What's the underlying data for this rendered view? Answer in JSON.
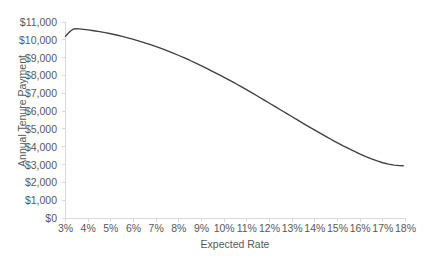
{
  "chart_data": {
    "type": "line",
    "title": "",
    "xlabel": "Expected Rate",
    "ylabel": "Annual Tenure Payment",
    "xlim": [
      3,
      18
    ],
    "ylim": [
      0,
      11000
    ],
    "grid": false,
    "legend": false,
    "legend_position": "none",
    "line_color": "#404040",
    "x_tick_labels": [
      "3%",
      "4%",
      "5%",
      "6%",
      "7%",
      "8%",
      "9%",
      "10%",
      "11%",
      "12%",
      "13%",
      "14%",
      "15%",
      "16%",
      "17%",
      "18%"
    ],
    "x_tick_values": [
      3,
      4,
      5,
      6,
      7,
      8,
      9,
      10,
      11,
      12,
      13,
      14,
      15,
      16,
      17,
      18
    ],
    "y_tick_labels": [
      "$0",
      "$1,000",
      "$2,000",
      "$3,000",
      "$4,000",
      "$5,000",
      "$6,000",
      "$7,000",
      "$8,000",
      "$9,000",
      "$10,000",
      "$11,000"
    ],
    "y_tick_values": [
      0,
      1000,
      2000,
      3000,
      4000,
      5000,
      6000,
      7000,
      8000,
      9000,
      10000,
      11000
    ],
    "series": [
      {
        "name": "Annual Tenure Payment",
        "x": [
          3.0,
          3.1,
          3.2,
          3.3,
          3.4,
          3.6,
          3.8,
          4.0,
          4.25,
          4.5,
          4.75,
          5.0,
          5.25,
          5.5,
          5.75,
          6.0,
          6.25,
          6.5,
          6.75,
          7.0,
          7.25,
          7.5,
          7.75,
          8.0,
          8.25,
          8.5,
          8.75,
          9.0,
          9.25,
          9.5,
          9.75,
          10.0,
          10.25,
          10.5,
          10.75,
          11.0,
          11.25,
          11.5,
          11.75,
          12.0,
          12.25,
          12.5,
          12.75,
          13.0,
          13.25,
          13.5,
          13.75,
          14.0,
          14.25,
          14.5,
          14.75,
          15.0,
          15.25,
          15.5,
          15.75,
          16.0,
          16.25,
          16.5,
          16.75,
          17.0,
          17.25,
          17.5,
          17.75,
          17.9
        ],
        "y": [
          10200,
          10340,
          10470,
          10570,
          10620,
          10610,
          10590,
          10560,
          10510,
          10460,
          10400,
          10340,
          10270,
          10190,
          10110,
          10020,
          9930,
          9830,
          9730,
          9620,
          9500,
          9380,
          9250,
          9120,
          8980,
          8840,
          8690,
          8540,
          8380,
          8220,
          8060,
          7890,
          7720,
          7550,
          7370,
          7190,
          7010,
          6820,
          6630,
          6440,
          6250,
          6060,
          5870,
          5680,
          5490,
          5300,
          5110,
          4930,
          4750,
          4570,
          4390,
          4220,
          4050,
          3890,
          3740,
          3590,
          3450,
          3320,
          3200,
          3100,
          3020,
          2970,
          2940,
          2930
        ]
      }
    ]
  }
}
